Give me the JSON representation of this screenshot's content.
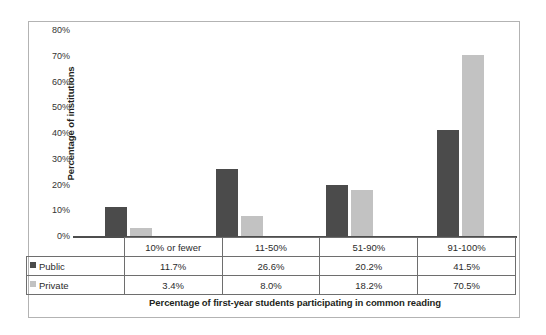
{
  "chart_data": {
    "type": "bar",
    "title": "",
    "subtitle": "",
    "xlabel": "Percentage of first-year students participating in common reading",
    "ylabel": "Percentage of institutions",
    "categories": [
      "10% or fewer",
      "11-50%",
      "51-90%",
      "91-100%"
    ],
    "series": [
      {
        "name": "Public",
        "color": "#4b4b4b",
        "values": [
          11.7,
          26.6,
          20.2,
          41.5
        ],
        "labels": [
          "11.7%",
          "26.6%",
          "20.2%",
          "41.5%"
        ]
      },
      {
        "name": "Private",
        "color": "#c2c2c2",
        "values": [
          3.4,
          8.0,
          18.2,
          70.5
        ],
        "labels": [
          "3.4%",
          "8.0%",
          "18.2%",
          "70.5%"
        ]
      }
    ],
    "ylim": [
      0,
      80
    ],
    "ytick_values": [
      0,
      10,
      20,
      30,
      40,
      50,
      60,
      70,
      80
    ],
    "ytick_labels": [
      "0%",
      "10%",
      "20%",
      "30%",
      "40%",
      "50%",
      "60%",
      "70%",
      "80%"
    ],
    "grid": false,
    "legend_position": "data-table-row-headers",
    "data_table_visible": true,
    "annotations": []
  },
  "figure": {
    "frame_color": "#b3b3b3",
    "axis_color": "#4d4d4d",
    "table_border_color": "#6e6e6e",
    "background": "#ffffff"
  }
}
